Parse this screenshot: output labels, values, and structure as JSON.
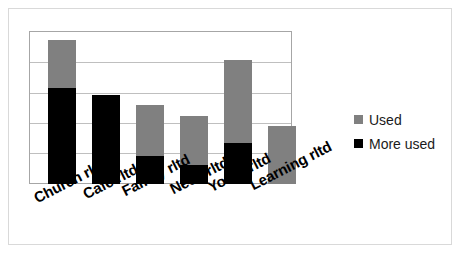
{
  "chart_data": {
    "type": "bar",
    "title": "",
    "subtitle": "",
    "xlabel": "",
    "ylabel": "",
    "stacked": true,
    "grid": true,
    "gridlines": 5,
    "ylim": [
      0,
      5
    ],
    "legend_position": "right",
    "categories": [
      "Church rltd",
      "Café rltd",
      "Family rltd",
      "Need rltd",
      "Youth rltd",
      "Learning rltd"
    ],
    "series": [
      {
        "name": "More used",
        "color": "#000000",
        "values": [
          3.17,
          2.94,
          0.95,
          0.65,
          1.37,
          0
        ]
      },
      {
        "name": "Used",
        "color": "#808080",
        "values": [
          1.57,
          0,
          1.71,
          1.61,
          3.7,
          1.93
        ]
      }
    ],
    "totals": [
      4.74,
      2.94,
      2.66,
      2.26,
      5.07,
      1.93
    ]
  },
  "bars": [
    {
      "name": "Church rltd",
      "left": 18,
      "width": 28,
      "used_top": 8,
      "more_top": 56,
      "bottom": 152
    },
    {
      "name": "Café rltd",
      "left": 62,
      "width": 28,
      "used_top": 63,
      "more_top": 63,
      "bottom": 152
    },
    {
      "name": "Family rltd",
      "left": 106,
      "width": 28,
      "used_top": 73,
      "more_top": 124,
      "bottom": 152
    },
    {
      "name": "Need rltd",
      "left": 150,
      "width": 28,
      "used_top": 84,
      "more_top": 133,
      "bottom": 152
    },
    {
      "name": "Youth rltd",
      "left": 194,
      "width": 28,
      "used_top": 28,
      "more_top": 111,
      "bottom": 152
    },
    {
      "name": "Learning rltd",
      "left": 238,
      "width": 28,
      "used_top": 94,
      "more_top": 152,
      "bottom": 152
    }
  ],
  "gridlines": [
    {
      "top": 30
    },
    {
      "top": 61
    },
    {
      "top": 91
    },
    {
      "top": 121
    }
  ],
  "x_axis": {
    "labels": [
      {
        "text": "Church rltd",
        "left": 22,
        "top": 182
      },
      {
        "text": "Café rltd",
        "left": 71,
        "top": 178
      },
      {
        "text": "Family rltd",
        "left": 110,
        "top": 175
      },
      {
        "text": "Need rltd",
        "left": 158,
        "top": 173
      },
      {
        "text": "Youth rltd",
        "left": 196,
        "top": 171
      },
      {
        "text": "Learning rltd",
        "left": 238,
        "top": 169
      }
    ]
  },
  "legend": {
    "items": [
      {
        "label": "Used",
        "color": "#808080"
      },
      {
        "label": "More used",
        "color": "#000000"
      }
    ]
  },
  "colors": {
    "used": "#808080",
    "more_used": "#000000",
    "plot_border": "#a6a6a6",
    "gridline": "#bfbfbf",
    "outer_border": "#d9d9d9",
    "background": "#ffffff"
  }
}
